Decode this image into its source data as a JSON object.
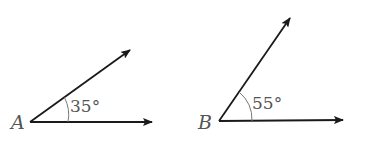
{
  "figure": {
    "angles": [
      {
        "vertex_label": "A",
        "measure_label": "35°",
        "measure": 35
      },
      {
        "vertex_label": "B",
        "measure_label": "55°",
        "measure": 55
      }
    ],
    "colors": {
      "line": "#1a1a1a",
      "text": "#555555",
      "background": "#ffffff"
    }
  }
}
